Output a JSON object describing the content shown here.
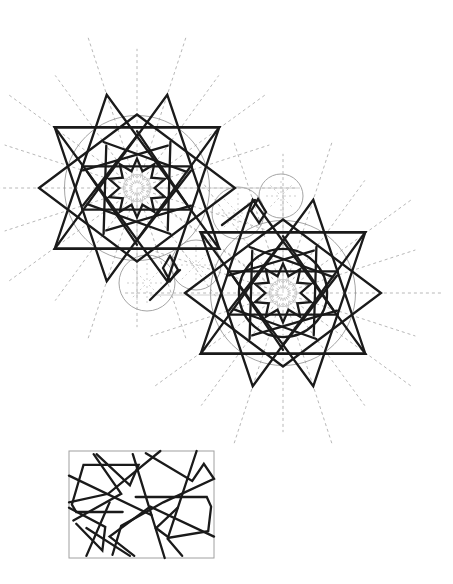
{
  "figure": {
    "title": "",
    "colors": {
      "background": "#ffffff",
      "pattern_lines": "#1a1a1a",
      "guide_lines": "#9a9a9a",
      "construction_rays": "#b8b8b8"
    },
    "rosettes": [
      {
        "name": "upper-left-rosette",
        "fold": 10,
        "inner_star_points": 10
      },
      {
        "name": "lower-right-rosette",
        "fold": 10,
        "inner_star_points": 10
      }
    ],
    "secondary_circles": 4,
    "repeat_tile": {
      "name": "repeat-tile",
      "shape": "rectangle"
    }
  }
}
